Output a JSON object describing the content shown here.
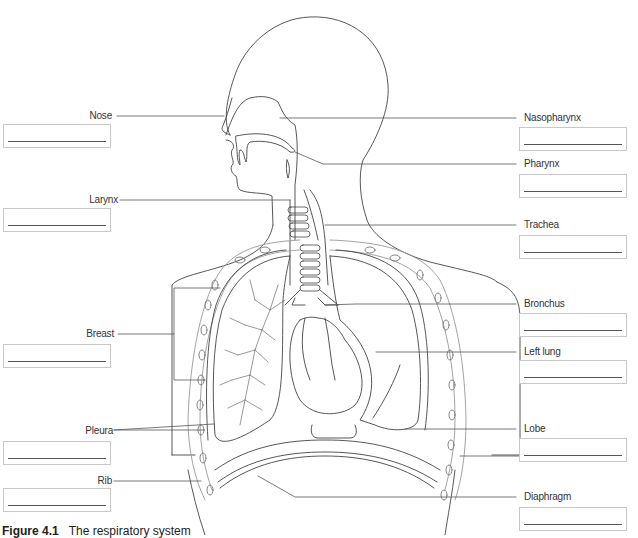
{
  "figure": {
    "caption_number": "Figure 4.1",
    "caption_text": "The respiratory system",
    "caption_partially_visible": true
  },
  "labels_left": [
    {
      "id": "nose",
      "text": "Nose",
      "answer": ""
    },
    {
      "id": "larynx",
      "text": "Larynx",
      "answer": ""
    },
    {
      "id": "breast",
      "text": "Breast",
      "answer": ""
    },
    {
      "id": "pleura",
      "text": "Pleura",
      "answer": ""
    },
    {
      "id": "rib",
      "text": "Rib",
      "answer": ""
    }
  ],
  "labels_right": [
    {
      "id": "nasopharynx",
      "text": "Nasopharynx",
      "answer": ""
    },
    {
      "id": "pharynx",
      "text": "Pharynx",
      "answer": ""
    },
    {
      "id": "trachea",
      "text": "Trachea",
      "answer": ""
    },
    {
      "id": "bronchus",
      "text": "Bronchus",
      "answer": ""
    },
    {
      "id": "left-lung",
      "text": "Left lung",
      "answer": ""
    },
    {
      "id": "lobe",
      "text": "Lobe",
      "answer": ""
    },
    {
      "id": "diaphragm",
      "text": "Diaphragm",
      "answer": ""
    }
  ],
  "colors": {
    "outline": "#444444",
    "leader": "#555555",
    "box_border": "#c8c8c8",
    "rib_outline": "#999999"
  }
}
